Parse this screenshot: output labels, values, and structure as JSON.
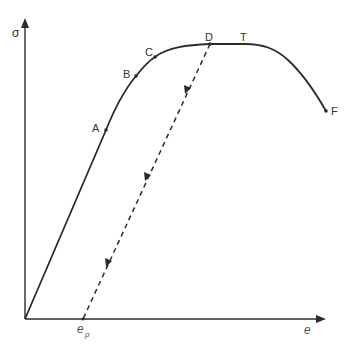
{
  "figure": {
    "type": "stress-strain diagram",
    "axes": {
      "y_label": "σ",
      "x_label": "e",
      "x_tick_label_main": "e",
      "x_tick_label_sub": "p"
    },
    "points": {
      "A": "A",
      "B": "B",
      "C": "C",
      "D": "D",
      "T": "T",
      "F": "F"
    },
    "colors": {
      "line": "#2b2b2b",
      "text": "#333333",
      "background": "#ffffff"
    }
  }
}
